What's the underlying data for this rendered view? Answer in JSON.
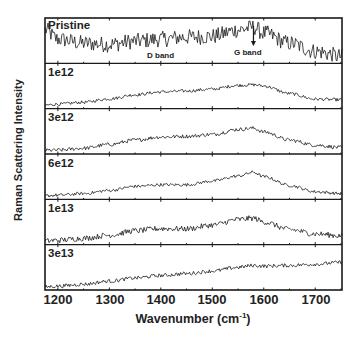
{
  "chart_data": {
    "type": "line",
    "title": "",
    "xlabel": "Wavenumber (cm-1)",
    "xlabel_main": "Wavenumber (cm",
    "xlabel_sup": "-1",
    "xlabel_close": ")",
    "ylabel": "Raman Scattering Intensity",
    "xlim": [
      1175,
      1752
    ],
    "x_ticks": [
      1200,
      1300,
      1400,
      1500,
      1600,
      1700
    ],
    "y_ticks": [],
    "grid": false,
    "legend": "none (panel labels inside each subplot)",
    "layout": "6 vertically stacked panels sharing x-axis",
    "annotations": [
      {
        "text": "D band",
        "x": 1350,
        "panel": "Pristine"
      },
      {
        "text": "G band",
        "x": 1580,
        "panel": "Pristine",
        "arrow": true
      }
    ],
    "x": [
      1175,
      1200,
      1250,
      1300,
      1350,
      1400,
      1450,
      1500,
      1550,
      1580,
      1600,
      1650,
      1700,
      1752
    ],
    "series": [
      {
        "name": "Pristine",
        "values": [
          0.78,
          0.55,
          0.45,
          0.42,
          0.5,
          0.55,
          0.6,
          0.62,
          0.78,
          0.85,
          0.7,
          0.45,
          0.25,
          0.12
        ],
        "noise": 0.2
      },
      {
        "name": "1e12",
        "values": [
          0.05,
          0.08,
          0.14,
          0.25,
          0.38,
          0.47,
          0.5,
          0.56,
          0.68,
          0.7,
          0.66,
          0.42,
          0.24,
          0.22
        ],
        "noise": 0.05
      },
      {
        "name": "3e12",
        "values": [
          0.05,
          0.06,
          0.12,
          0.24,
          0.38,
          0.48,
          0.5,
          0.56,
          0.72,
          0.76,
          0.64,
          0.38,
          0.22,
          0.14
        ],
        "noise": 0.06
      },
      {
        "name": "6e12",
        "values": [
          0.05,
          0.07,
          0.12,
          0.22,
          0.35,
          0.4,
          0.4,
          0.52,
          0.68,
          0.8,
          0.66,
          0.38,
          0.18,
          0.12
        ],
        "noise": 0.05
      },
      {
        "name": "1e13",
        "values": [
          0.05,
          0.08,
          0.14,
          0.24,
          0.38,
          0.45,
          0.44,
          0.56,
          0.74,
          0.78,
          0.66,
          0.42,
          0.28,
          0.22
        ],
        "noise": 0.09
      },
      {
        "name": "3e13",
        "values": [
          0.04,
          0.06,
          0.12,
          0.22,
          0.32,
          0.4,
          0.46,
          0.54,
          0.66,
          0.72,
          0.7,
          0.72,
          0.76,
          0.82
        ],
        "noise": 0.06
      }
    ]
  },
  "axis": {
    "ylabel": "Raman Scattering Intensity",
    "xlabel_main": "Wavenumber (cm",
    "xlabel_sup": "-1",
    "xlabel_close": ")",
    "ticks": [
      "1200",
      "1300",
      "1400",
      "1500",
      "1600",
      "1700"
    ]
  },
  "panels": [
    "Pristine",
    "1e12",
    "3e12",
    "6e12",
    "1e13",
    "3e13"
  ],
  "annotations": {
    "d_band": "D band",
    "g_band": "G band"
  },
  "colors": {
    "line": "#1a1a1a",
    "frame": "#1a1a1a",
    "background": "#ffffff"
  }
}
